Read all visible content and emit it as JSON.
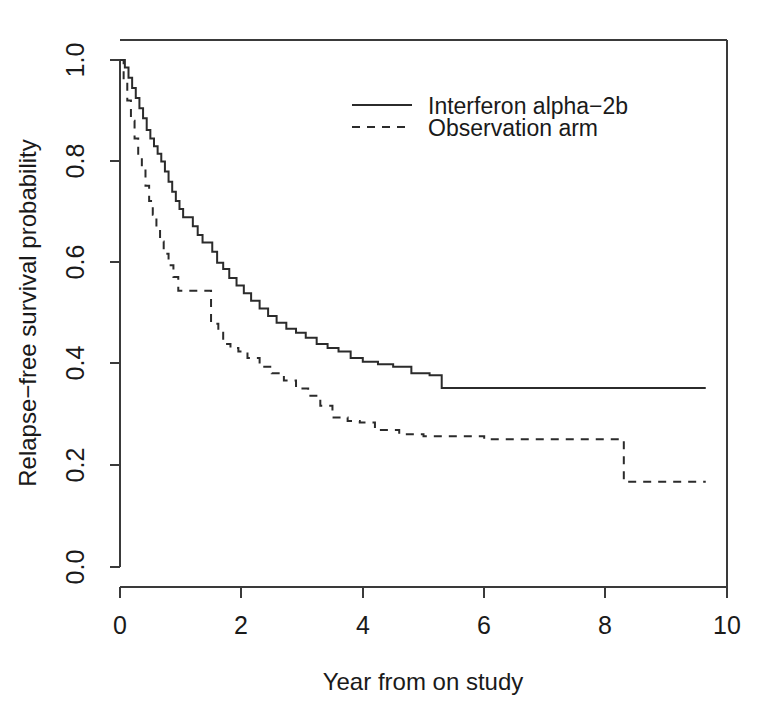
{
  "chart_data": {
    "type": "line",
    "subtype": "kaplan-meier-step",
    "title": "",
    "xlabel": "Year from on study",
    "ylabel": "Relapse−free survival probability",
    "xlim": [
      0,
      10
    ],
    "ylim": [
      0.0,
      1.0
    ],
    "xticks": [
      0,
      2,
      4,
      6,
      8,
      10
    ],
    "xtick_labels": [
      "0",
      "2",
      "4",
      "6",
      "8",
      "10"
    ],
    "yticks": [
      0.0,
      0.2,
      0.4,
      0.6,
      0.8,
      1.0
    ],
    "ytick_labels": [
      "0.0",
      "0.2",
      "0.4",
      "0.6",
      "0.8",
      "1.0"
    ],
    "grid": false,
    "legend_position": "top-center",
    "series": [
      {
        "name": "Interferon alpha−2b",
        "style": "solid",
        "color": "#2b2b2b",
        "x": [
          0.0,
          0.08,
          0.14,
          0.2,
          0.26,
          0.32,
          0.38,
          0.44,
          0.5,
          0.56,
          0.62,
          0.68,
          0.74,
          0.8,
          0.86,
          0.92,
          0.98,
          1.04,
          1.12,
          1.2,
          1.28,
          1.36,
          1.44,
          1.52,
          1.6,
          1.7,
          1.8,
          1.92,
          2.04,
          2.16,
          2.3,
          2.44,
          2.58,
          2.74,
          2.9,
          3.06,
          3.24,
          3.42,
          3.6,
          3.8,
          4.0,
          4.25,
          4.5,
          4.8,
          5.1,
          5.3,
          9.65
        ],
        "y": [
          1.0,
          0.985,
          0.965,
          0.945,
          0.925,
          0.905,
          0.885,
          0.862,
          0.845,
          0.83,
          0.815,
          0.8,
          0.78,
          0.76,
          0.74,
          0.722,
          0.706,
          0.69,
          0.69,
          0.672,
          0.655,
          0.64,
          0.64,
          0.622,
          0.6,
          0.588,
          0.57,
          0.555,
          0.54,
          0.525,
          0.51,
          0.495,
          0.482,
          0.47,
          0.462,
          0.452,
          0.44,
          0.432,
          0.425,
          0.412,
          0.405,
          0.4,
          0.395,
          0.382,
          0.378,
          0.353,
          0.353
        ]
      },
      {
        "name": "Observation arm",
        "style": "dashed",
        "color": "#2b2b2b",
        "x": [
          0.0,
          0.06,
          0.12,
          0.18,
          0.24,
          0.3,
          0.36,
          0.42,
          0.48,
          0.54,
          0.6,
          0.66,
          0.72,
          0.8,
          0.88,
          0.96,
          1.06,
          1.3,
          1.5,
          1.62,
          1.7,
          1.82,
          1.95,
          2.1,
          2.3,
          2.5,
          2.7,
          2.9,
          3.1,
          3.3,
          3.5,
          3.75,
          3.95,
          4.2,
          4.6,
          5.0,
          6.0,
          8.25,
          8.3,
          9.65
        ],
        "y": [
          1.0,
          0.96,
          0.92,
          0.88,
          0.845,
          0.812,
          0.782,
          0.752,
          0.722,
          0.695,
          0.668,
          0.642,
          0.618,
          0.595,
          0.572,
          0.545,
          0.545,
          0.545,
          0.48,
          0.462,
          0.44,
          0.432,
          0.425,
          0.412,
          0.395,
          0.382,
          0.368,
          0.352,
          0.338,
          0.318,
          0.295,
          0.288,
          0.285,
          0.27,
          0.262,
          0.258,
          0.252,
          0.252,
          0.168,
          0.168
        ]
      }
    ]
  },
  "legend": {
    "entries": [
      {
        "label": "Interferon alpha−2b",
        "style": "solid"
      },
      {
        "label": "Observation arm",
        "style": "dashed"
      }
    ]
  },
  "axes": {
    "x_title": "Year from on study",
    "y_title": "Relapse−free survival probability",
    "x_tick_labels": [
      "0",
      "2",
      "4",
      "6",
      "8",
      "10"
    ],
    "y_tick_labels": [
      "0.0",
      "0.2",
      "0.4",
      "0.6",
      "0.8",
      "1.0"
    ]
  }
}
